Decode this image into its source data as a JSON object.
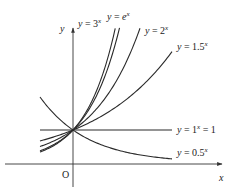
{
  "chart_data": {
    "type": "line",
    "title": "",
    "xlabel": "x",
    "ylabel": "y",
    "origin_label": "O",
    "xlim": [
      -1,
      3
    ],
    "ylim": [
      0,
      4.1
    ],
    "grid": false,
    "legend_position": "inline labels at curve ends",
    "series": [
      {
        "name": "y = 3^x",
        "label": "y = 3",
        "exp": "x",
        "base": 3,
        "x": [
          -1,
          1.28
        ],
        "label_pos": [
          78,
          27
        ]
      },
      {
        "name": "y = e^x",
        "label": "y = e",
        "exp": "x",
        "base": 2.71828,
        "x": [
          -1,
          1.41
        ],
        "label_pos": [
          107,
          20
        ]
      },
      {
        "name": "y = 2^x",
        "label": "y = 2",
        "exp": "x",
        "base": 2,
        "x": [
          -1,
          2.03
        ],
        "label_pos": [
          145,
          34
        ]
      },
      {
        "name": "y = 1.5^x",
        "label": "y = 1.5",
        "exp": "x",
        "base": 1.5,
        "x": [
          -1,
          3.0
        ],
        "label_pos": [
          177,
          50
        ]
      },
      {
        "name": "y = 1^x = 1",
        "label": "y = 1",
        "exp": "x",
        "suffix": " = 1",
        "base": 1,
        "x": [
          -1,
          3.0
        ],
        "label_pos": [
          177,
          133
        ]
      },
      {
        "name": "y = 0.5^x",
        "label": "y = 0.5",
        "exp": "x",
        "base": 0.5,
        "x": [
          -1,
          3.0
        ],
        "label_pos": [
          177,
          156
        ]
      }
    ],
    "common_point": {
      "x": 0,
      "y": 1
    }
  },
  "layout": {
    "origin_px": [
      73,
      163
    ],
    "unit_px": 33,
    "x_axis": {
      "from": 5,
      "to": 222,
      "y": 164
    },
    "y_axis": {
      "x": 73,
      "from": 187,
      "to": 28
    }
  }
}
